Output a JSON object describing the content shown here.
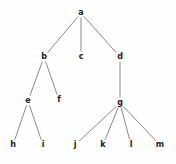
{
  "figure": {
    "kind": "rooted-tree-diagram",
    "width": 176,
    "height": 164,
    "background_color": "#fefefe",
    "edge_color": "#8a8a8a",
    "edge_width": 1,
    "label_color": "#1c1c1c"
  },
  "tree": {
    "root": "a",
    "nodes": [
      {
        "id": "a",
        "label": "a",
        "x": 81,
        "y": 13,
        "depth": 0
      },
      {
        "id": "b",
        "label": "b",
        "x": 44,
        "y": 57,
        "depth": 1
      },
      {
        "id": "c",
        "label": "c",
        "x": 81,
        "y": 57,
        "depth": 1
      },
      {
        "id": "d",
        "label": "d",
        "x": 120,
        "y": 57,
        "depth": 1
      },
      {
        "id": "e",
        "label": "e",
        "x": 28,
        "y": 101,
        "depth": 2
      },
      {
        "id": "f",
        "label": "f",
        "x": 59,
        "y": 100,
        "depth": 2
      },
      {
        "id": "g",
        "label": "g",
        "x": 120,
        "y": 103,
        "depth": 2
      },
      {
        "id": "h",
        "label": "h",
        "x": 13,
        "y": 145,
        "depth": 3
      },
      {
        "id": "i",
        "label": "i",
        "x": 43,
        "y": 145,
        "depth": 3
      },
      {
        "id": "j",
        "label": "j",
        "x": 75,
        "y": 145,
        "depth": 3
      },
      {
        "id": "k",
        "label": "k",
        "x": 103,
        "y": 145,
        "depth": 3
      },
      {
        "id": "l",
        "label": "l",
        "x": 131,
        "y": 145,
        "depth": 3
      },
      {
        "id": "m",
        "label": "m",
        "x": 160,
        "y": 145,
        "depth": 3
      }
    ],
    "edges": [
      {
        "from": "a",
        "to": "b"
      },
      {
        "from": "a",
        "to": "c"
      },
      {
        "from": "a",
        "to": "d"
      },
      {
        "from": "b",
        "to": "e"
      },
      {
        "from": "b",
        "to": "f"
      },
      {
        "from": "d",
        "to": "g"
      },
      {
        "from": "e",
        "to": "h"
      },
      {
        "from": "e",
        "to": "i"
      },
      {
        "from": "g",
        "to": "j"
      },
      {
        "from": "g",
        "to": "k"
      },
      {
        "from": "g",
        "to": "l"
      },
      {
        "from": "g",
        "to": "m"
      }
    ]
  }
}
